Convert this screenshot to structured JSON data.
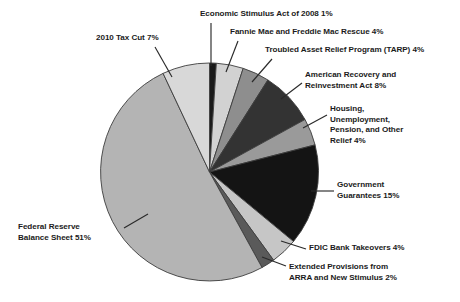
{
  "chart_data": {
    "type": "pie",
    "title": "",
    "subtitle": "",
    "xlabel": "",
    "ylabel": "",
    "legend_position": "callout-labels",
    "grid": false,
    "units": "percent",
    "start_angle_deg": 0,
    "direction": "clockwise",
    "categories": [
      "Economic Stimulus Act of 2008",
      "Fannie Mae and Freddie Mac Rescue",
      "Troubled Asset Relief Program (TARP)",
      "American Recovery and Reinvestment Act",
      "Housing, Unemployment, Pension, and Other Relief",
      "Government Guarantees",
      "FDIC Bank Takeovers",
      "Extended Provisions from ARRA and New Stimulus",
      "Federal Reserve Balance Sheet",
      "2010 Tax Cut"
    ],
    "values": [
      1,
      4,
      4,
      8,
      4,
      15,
      4,
      2,
      51,
      7
    ],
    "colors": [
      "#1a1a1a",
      "#d2d2d2",
      "#8e8e8e",
      "#333333",
      "#9a9a9a",
      "#141414",
      "#c6c6c6",
      "#5a5a5a",
      "#b4b4b4",
      "#d8d8d8"
    ],
    "slices": [
      {
        "label": "Economic Stimulus Act of 2008",
        "value": 1,
        "color": "#1a1a1a"
      },
      {
        "label": "Fannie Mae and Freddie Mac Rescue",
        "value": 4,
        "color": "#d2d2d2"
      },
      {
        "label": "Troubled Asset Relief Program (TARP)",
        "value": 4,
        "color": "#8e8e8e"
      },
      {
        "label": "American Recovery and Reinvestment Act",
        "value": 8,
        "color": "#333333"
      },
      {
        "label": "Housing, Unemployment, Pension, and Other Relief",
        "value": 4,
        "color": "#9a9a9a"
      },
      {
        "label": "Government Guarantees",
        "value": 15,
        "color": "#141414"
      },
      {
        "label": "FDIC Bank Takeovers",
        "value": 4,
        "color": "#c6c6c6"
      },
      {
        "label": "Extended Provisions from ARRA and New Stimulus",
        "value": 2,
        "color": "#5a5a5a"
      },
      {
        "label": "Federal Reserve Balance Sheet",
        "value": 51,
        "color": "#b4b4b4"
      },
      {
        "label": "2010 Tax Cut",
        "value": 7,
        "color": "#d8d8d8"
      }
    ]
  },
  "callouts": {
    "economic_stimulus": "Economic Stimulus Act of 2008 1%",
    "fannie_freddie": "Fannie Mae and Freddie Mac Rescue 4%",
    "tarp": "Troubled Asset Relief Program (TARP) 4%",
    "american_recovery": "American Recovery and\nReinvestment Act 8%",
    "housing": "Housing,\nUnemployment,\nPension, and Other\nRelief 4%",
    "government_guarantees": "Government\nGuarantees 15%",
    "fdic": "FDIC Bank Takeovers 4%",
    "extended_provisions": "Extended Provisions from\nARRA and New Stimulus 2%",
    "federal_reserve": "Federal Reserve\nBalance Sheet 51%",
    "tax_cut": "2010 Tax Cut 7%"
  },
  "style": {
    "background": "#ffffff",
    "text_color": "#1b1b1b",
    "leader_line_color": "#2a2a2a",
    "slice_border_color": "#3c3c3c"
  }
}
